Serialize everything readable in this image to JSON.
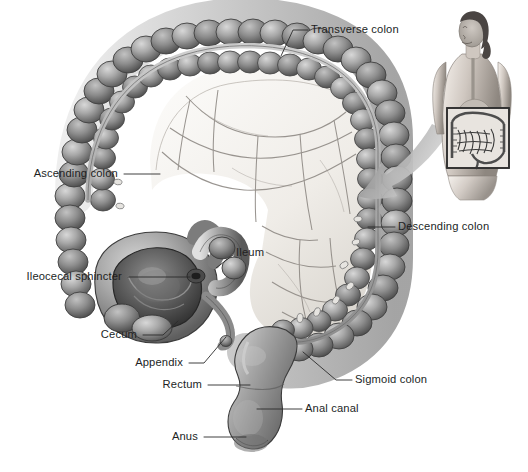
{
  "figure": {
    "background_color": "#ffffff",
    "width": 528,
    "height": 472,
    "style": "grayscale medical illustration"
  },
  "palette": {
    "ink": "#221f1f",
    "leader_line": "#2b2b2b",
    "colon_light": "#cfcfcf",
    "colon_mid": "#9a9a9a",
    "colon_dark": "#5d5d5d",
    "colon_outline": "#3c3c3c",
    "mesentery_light": "#f2f0ec",
    "mesentery_shadow": "#d9d6d0",
    "vessel": "#7b7b7b",
    "arrow": "#9c9c9c",
    "skin_light": "#dcd6d0",
    "skin_mid": "#b5ada6",
    "skin_dark": "#7e7872",
    "hair": "#4a4543",
    "inset_box": "#2f2f2f"
  },
  "labels": [
    {
      "id": "transverse-colon",
      "text": "Transverse colon",
      "align": "left",
      "text_x": 311,
      "text_y": 30,
      "leader": "M 308 30 L 293 30 L 281 56"
    },
    {
      "id": "ascending-colon",
      "text": "Ascending colon",
      "align": "right",
      "text_x": 118,
      "text_y": 174,
      "leader": "M 124 174 L 160 174"
    },
    {
      "id": "ileocecal-sphincter",
      "text": "Ileocecal sphincter",
      "align": "right",
      "text_x": 122,
      "text_y": 277,
      "leader": "M 128 277 L 190 277"
    },
    {
      "id": "ileum",
      "text": "Ileum",
      "align": "left",
      "text_x": 236,
      "text_y": 253,
      "leader": "M 233 255 L 216 268"
    },
    {
      "id": "cecum",
      "text": "Cecum",
      "align": "right",
      "text_x": 137,
      "text_y": 335,
      "leader": "M 143 335 L 163 335 L 178 321"
    },
    {
      "id": "appendix",
      "text": "Appendix",
      "align": "right",
      "text_x": 183,
      "text_y": 363,
      "leader": "M 189 363 L 204 363 L 226 337"
    },
    {
      "id": "descending-colon",
      "text": "Descending colon",
      "align": "left",
      "text_x": 398,
      "text_y": 227,
      "leader": "M 395 227 L 368 227"
    },
    {
      "id": "sigmoid-colon",
      "text": "Sigmoid colon",
      "align": "left",
      "text_x": 355,
      "text_y": 380,
      "leader": "M 352 380 L 336 380 L 303 352"
    },
    {
      "id": "rectum",
      "text": "Rectum",
      "align": "right",
      "text_x": 202,
      "text_y": 385,
      "leader": "M 208 385 L 250 385"
    },
    {
      "id": "anal-canal",
      "text": "Anal canal",
      "align": "left",
      "text_x": 305,
      "text_y": 409,
      "leader": "M 302 409 L 257 409"
    },
    {
      "id": "anus",
      "text": "Anus",
      "align": "right",
      "text_x": 198,
      "text_y": 437,
      "leader": "M 204 437 L 246 437"
    }
  ],
  "inset": {
    "id": "body-orientation-inset",
    "description": "female torso showing abdominal region",
    "box": {
      "x": 447,
      "y": 108,
      "width": 62,
      "height": 60
    },
    "arrow": {
      "description": "curved arrow from inset to main illustration"
    }
  },
  "anatomy_parts": [
    "transverse colon",
    "ascending colon",
    "descending colon",
    "sigmoid colon",
    "cecum",
    "appendix",
    "ileum",
    "ileocecal sphincter",
    "rectum",
    "anal canal",
    "anus",
    "mesentery",
    "haustra",
    "teniae coli",
    "epiploic appendages"
  ]
}
